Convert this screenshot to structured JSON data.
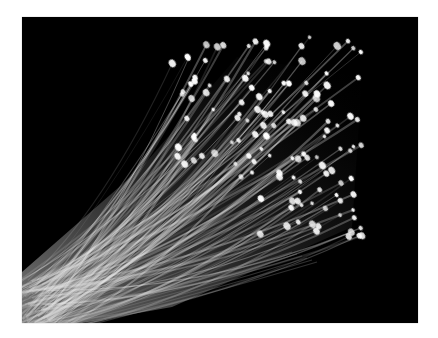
{
  "image": {
    "subject": "fiber optic strands with glowing tips on black background",
    "alt": "Bundle of fiber optic cables fanning out with illuminated ends",
    "colors": {
      "frame": "#ffffff",
      "background": "#000000",
      "strand": "#e8e8e8",
      "tip": "#ffffff"
    }
  }
}
